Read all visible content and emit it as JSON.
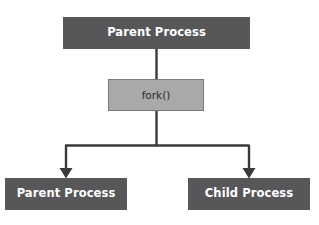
{
  "diagram": {
    "background_color": "#ffffff",
    "node_fill_process": "#57575a",
    "node_fill_fork": "#a9a9a9",
    "node_text_process": "#ffffff",
    "node_text_fork": "#2b2b2b",
    "connector_color": "#3a3a3a",
    "nodes": {
      "parent_top": {
        "label": "Parent Process",
        "role": "caller"
      },
      "fork_call": {
        "label": "fork()",
        "role": "system-call"
      },
      "parent_bottom": {
        "label": "Parent Process",
        "role": "original-process"
      },
      "child_bottom": {
        "label": "Child Process",
        "role": "forked-process"
      }
    },
    "edges": [
      {
        "from": "parent_top",
        "to": "fork_call",
        "style": "line",
        "arrow": false
      },
      {
        "from": "fork_call",
        "to": "parent_bottom",
        "style": "elbow",
        "arrow": true
      },
      {
        "from": "fork_call",
        "to": "child_bottom",
        "style": "elbow",
        "arrow": true
      }
    ]
  }
}
